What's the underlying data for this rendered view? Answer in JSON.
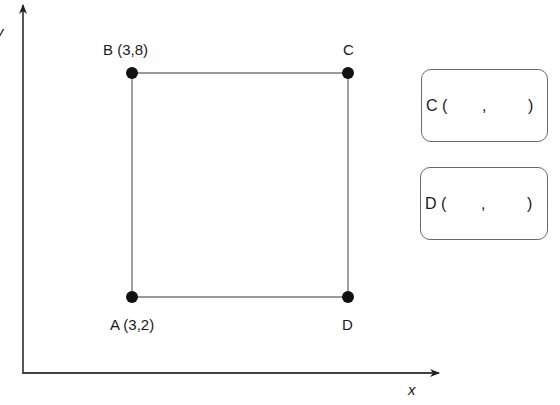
{
  "axes": {
    "x_label": "x",
    "y_label": "y"
  },
  "points": [
    {
      "id": "A",
      "label": "A (3,2)"
    },
    {
      "id": "B",
      "label": "B (3,8)"
    },
    {
      "id": "C",
      "label": "C"
    },
    {
      "id": "D",
      "label": "D"
    }
  ],
  "answers": [
    {
      "id": "C",
      "name": "C",
      "open": "(",
      "x_value": "",
      "comma": ",",
      "y_value": "",
      "close": ")"
    },
    {
      "id": "D",
      "name": "D",
      "open": "(",
      "x_value": "",
      "comma": ",",
      "y_value": "",
      "close": ")"
    }
  ],
  "colors": {
    "axis": "#444444",
    "edge": "#777777",
    "point": "#111111",
    "box_border": "#6a6a6a"
  }
}
